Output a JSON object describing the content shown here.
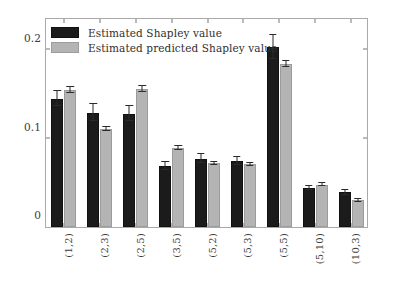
{
  "chart_data": {
    "type": "bar",
    "title": "",
    "xlabel": "",
    "ylabel": "",
    "categories": [
      "(1,2)",
      "(2,3)",
      "(2,5)",
      "(3,5)",
      "(5,2)",
      "(5,3)",
      "(5,5)",
      "(5,10)",
      "(10,3)"
    ],
    "ylim": [
      0,
      0.235
    ],
    "yticks": [
      0,
      0.1,
      0.2
    ],
    "ytick_labels": [
      "0",
      "0.1",
      "0.2"
    ],
    "grid": false,
    "legend_position": "top-left",
    "series": [
      {
        "name": "Estimated Shapley value",
        "color": "#1b1b1b",
        "values": [
          0.145,
          0.129,
          0.128,
          0.069,
          0.077,
          0.075,
          0.203,
          0.044,
          0.039
        ],
        "errors": [
          0.0085,
          0.0095,
          0.0085,
          0.005,
          0.005,
          0.0045,
          0.0135,
          0.0025,
          0.003
        ]
      },
      {
        "name": "Estimated predicted Shapley value",
        "color": "#b4b4b4",
        "values": [
          0.155,
          0.111,
          0.156,
          0.089,
          0.072,
          0.071,
          0.184,
          0.048,
          0.03
        ],
        "errors": [
          0.0035,
          0.0025,
          0.0035,
          0.002,
          0.0015,
          0.0015,
          0.0035,
          0.0015,
          0.0015
        ]
      }
    ]
  },
  "legend": {
    "items": [
      {
        "label": "Estimated Shapley value",
        "swatch": "dark"
      },
      {
        "label": "Estimated predicted Shapley value",
        "swatch": "light"
      }
    ]
  }
}
